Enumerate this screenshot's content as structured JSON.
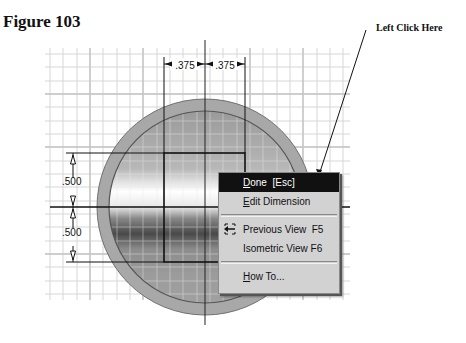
{
  "figure": {
    "title": "Figure 103",
    "callout": "Left Click Here"
  },
  "sketch": {
    "dimensions": {
      "top_left": ".375",
      "top_right": ".375",
      "left_upper": ".500",
      "left_lower": ".500"
    },
    "colors": {
      "grid": "#d8d8d8",
      "circle_outer": "#a9a9a9",
      "circle_ring": "#6f6f6f",
      "line": "#111111"
    }
  },
  "context_menu": {
    "items": [
      {
        "mnemonic": "D",
        "rest": "one  [Esc]",
        "active": true
      },
      {
        "mnemonic": "E",
        "rest": "dit Dimension",
        "active": false
      },
      {
        "label": "Previous View  F5",
        "icon": "previous-view-icon"
      },
      {
        "label": "Isometric View F6"
      },
      {
        "mnemonic": "H",
        "rest": "ow To..."
      }
    ]
  }
}
